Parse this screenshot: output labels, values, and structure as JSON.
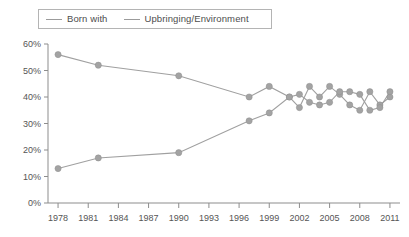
{
  "legend": {
    "position": "top-left",
    "entries": [
      {
        "label": "Born with",
        "color": "#a0a0a0",
        "icon": "line-swatch-icon"
      },
      {
        "label": "Upbringing/Environment",
        "color": "#a0a0a0",
        "icon": "line-swatch-icon"
      }
    ]
  },
  "axes": {
    "y_ticks": [
      "0%",
      "10%",
      "20%",
      "30%",
      "40%",
      "50%",
      "60%"
    ],
    "x_ticks": [
      "1978",
      "1981",
      "1984",
      "1987",
      "1990",
      "1993",
      "1996",
      "1999",
      "2002",
      "2005",
      "2008",
      "2011"
    ]
  },
  "colors": {
    "line": "#a0a0a0",
    "marker": "#a3a3a3",
    "axis": "#8d8d8d",
    "text": "#555555",
    "legend_border": "#b4b4b4",
    "background": "#ffffff"
  },
  "chart_data": {
    "type": "line",
    "title": "",
    "subtitle": "",
    "xlabel": "",
    "ylabel": "",
    "xlim": [
      1977,
      2012
    ],
    "ylim": [
      0,
      60
    ],
    "y_tick_values": [
      0,
      10,
      20,
      30,
      40,
      50,
      60
    ],
    "y_tick_labels": [
      "0%",
      "10%",
      "20%",
      "30%",
      "40%",
      "50%",
      "60%"
    ],
    "x_tick_values": [
      1978,
      1981,
      1984,
      1987,
      1990,
      1993,
      1996,
      1999,
      2002,
      2005,
      2008,
      2011
    ],
    "x_tick_labels": [
      "1978",
      "1981",
      "1984",
      "1987",
      "1990",
      "1993",
      "1996",
      "1999",
      "2002",
      "2005",
      "2008",
      "2011"
    ],
    "grid": false,
    "legend_position": "top-left",
    "units": "percent",
    "markers": true,
    "series": [
      {
        "name": "Born with",
        "color": "#a0a0a0",
        "x": [
          1978,
          1982,
          1990,
          1997,
          1999,
          2001,
          2002,
          2003,
          2004,
          2005,
          2006,
          2007,
          2008,
          2009,
          2010,
          2011
        ],
        "values": [
          56,
          52,
          48,
          40,
          44,
          40,
          36,
          44,
          40,
          44,
          41,
          37,
          35,
          42,
          37,
          40
        ]
      },
      {
        "name": "Upbringing/Environment",
        "color": "#a0a0a0",
        "x": [
          1978,
          1982,
          1990,
          1997,
          1999,
          2001,
          2002,
          2003,
          2004,
          2005,
          2006,
          2007,
          2008,
          2009,
          2010,
          2011
        ],
        "values": [
          13,
          17,
          19,
          31,
          34,
          40,
          41,
          38,
          37,
          38,
          42,
          42,
          41,
          35,
          36,
          42
        ]
      }
    ]
  }
}
